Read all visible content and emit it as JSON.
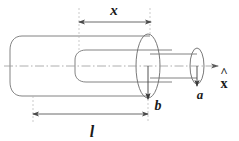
{
  "figure": {
    "background_color": "#ffffff",
    "line_color": "#6e6e6e",
    "dim_line_color": "#555555",
    "label_color": "#1a1a1a",
    "axis_color": "#8a8a8a"
  },
  "labels": {
    "x_dimension": "x",
    "l_dimension": "l",
    "inner_radius": "b",
    "outer_radius": "a",
    "axis_unit_vector": "x",
    "axis_hat": "^"
  },
  "dimensions": {
    "x": {
      "symbol": "x",
      "description": "insertion length of inner cylinder measured from left reference to middle ellipse plane",
      "arrow_y": 22,
      "x_start": 79,
      "x_end": 151,
      "label_x": 114,
      "label_y": 14
    },
    "l": {
      "symbol": "l",
      "description": "total length of outer cylinder",
      "arrow_y": 114,
      "x_start": 33,
      "x_end": 148,
      "label_x": 92,
      "label_y": 135
    },
    "b": {
      "symbol": "b",
      "description": "radius of the large middle cylinder, drawn from axis downward",
      "arrow_x": 148,
      "y_start": 66,
      "y_end": 97,
      "label_x": 158,
      "label_y": 108
    },
    "a": {
      "symbol": "a",
      "description": "radius of the small right cylinder, drawn from axis downward",
      "arrow_x": 197,
      "y_start": 66,
      "y_end": 84,
      "label_x": 200,
      "label_y": 98
    }
  },
  "geometry": {
    "axis": {
      "name": "center-axis",
      "y": 66,
      "x_start": 4,
      "x_end": 222,
      "style": "dash-dot"
    },
    "cylinders": [
      {
        "name": "outer-cylinder",
        "left_cap_x": 12,
        "right_x": 150,
        "top_y": 36,
        "bottom_y": 96,
        "semi_minor": 10
      },
      {
        "name": "middle-cylinder",
        "left_cap_x": 76,
        "right_x": 172,
        "top_y": 50,
        "bottom_y": 82,
        "semi_minor": 7
      },
      {
        "name": "inner-cylinder",
        "left_cap_x": 150,
        "right_x": 197,
        "top_y": 56,
        "bottom_y": 76,
        "semi_minor": 5
      }
    ],
    "ellipses": [
      {
        "name": "middle-face-ellipse",
        "cx": 148,
        "cy": 66,
        "rx": 12,
        "ry": 32
      },
      {
        "name": "inner-face-ellipse",
        "cx": 197,
        "cy": 66,
        "rx": 7,
        "ry": 18
      }
    ],
    "reference_lines": [
      {
        "name": "x-dim-left-extension",
        "x": 79,
        "y_top": 8,
        "y_bottom": 52
      },
      {
        "name": "x-dim-right-extension",
        "x": 150,
        "y_top": 8,
        "y_bottom": 36
      },
      {
        "name": "l-dim-left-extension",
        "x": 33,
        "y_top": 96,
        "y_bottom": 126
      },
      {
        "name": "l-dim-right-extension",
        "x": 148,
        "y_top": 98,
        "y_bottom": 126
      }
    ]
  }
}
